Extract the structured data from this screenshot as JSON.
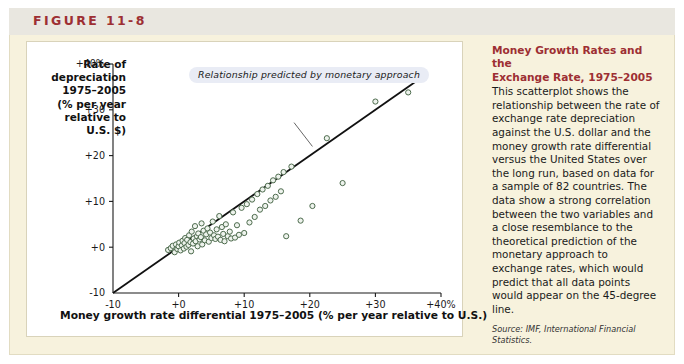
{
  "figure": {
    "label": "FIGURE 11-8",
    "label_color": "#9d2f33",
    "card_background": "#f7f2dd",
    "header_band_color": "#e9e7e0",
    "panel_background": "#ffffff"
  },
  "sidebar": {
    "title_line1": "Money Growth Rates and the",
    "title_line2": "Exchange Rate, 1975–2005",
    "body": "This scatterplot shows the relationship between the rate of exchange rate depreciation against the U.S. dollar and the money growth rate differential versus the United States over the long run, based on data for a sample of 82 countries. The data show a strong correlation between the two variables and a close resemblance to the theoretical prediction of the monetary approach to exchange rates, which would predict that all data points would appear on the 45-degree line.",
    "source": "Source: IMF, International Financial Statistics."
  },
  "chart_data": {
    "type": "scatter",
    "title": "",
    "xlabel": "Money growth rate differential 1975–2005 (% per year relative to U.S.)",
    "ylabel_lines": [
      "Rate of",
      "depreciation",
      "1975–2005",
      "(% per year",
      "relative to",
      "U.S. $)"
    ],
    "xlim": [
      -10,
      40
    ],
    "ylim": [
      -10,
      40
    ],
    "xticks": [
      -10,
      0,
      10,
      20,
      30,
      40
    ],
    "xtick_labels": [
      "-10",
      "+0",
      "+10",
      "+20",
      "+30",
      "+40%"
    ],
    "yticks": [
      -10,
      0,
      10,
      20,
      30,
      40
    ],
    "ytick_labels": [
      "-10",
      "+0",
      "+10",
      "+20",
      "+30",
      "+40%"
    ],
    "grid": false,
    "legend": "none",
    "marker": {
      "shape": "open-circle",
      "stroke_color": "#4d6b4d",
      "fill_color": "#eef3ed",
      "radius": 2.6
    },
    "reference_line": {
      "name": "45-degree line",
      "color": "#111111",
      "from": [
        -10,
        -10
      ],
      "to": [
        36,
        36
      ],
      "slope": 1,
      "intercept": 0
    },
    "annotation": {
      "text": "Relationship predicted by monetary approach",
      "background": "#e9ecf5",
      "leader_from": [
        17.6,
        27.2
      ],
      "leader_to": [
        20.4,
        22.0
      ]
    },
    "n_points": 82,
    "points": [
      [
        -1.6,
        -0.6
      ],
      [
        -1.2,
        -0.2
      ],
      [
        -0.9,
        0.3
      ],
      [
        -0.6,
        -1.1
      ],
      [
        -0.4,
        0.6
      ],
      [
        -0.2,
        -0.4
      ],
      [
        0.0,
        0.2
      ],
      [
        0.1,
        1.0
      ],
      [
        0.3,
        -0.7
      ],
      [
        0.5,
        0.4
      ],
      [
        0.6,
        1.4
      ],
      [
        0.8,
        -0.3
      ],
      [
        0.9,
        0.9
      ],
      [
        1.0,
        2.0
      ],
      [
        1.2,
        0.1
      ],
      [
        1.3,
        1.6
      ],
      [
        1.5,
        0.5
      ],
      [
        1.6,
        2.6
      ],
      [
        1.8,
        1.1
      ],
      [
        1.9,
        -0.9
      ],
      [
        2.0,
        3.4
      ],
      [
        2.2,
        0.8
      ],
      [
        2.3,
        1.9
      ],
      [
        2.5,
        4.6
      ],
      [
        2.6,
        1.3
      ],
      [
        2.8,
        2.4
      ],
      [
        2.9,
        0.2
      ],
      [
        3.0,
        3.0
      ],
      [
        3.2,
        1.7
      ],
      [
        3.4,
        2.2
      ],
      [
        3.5,
        5.2
      ],
      [
        3.6,
        0.6
      ],
      [
        3.8,
        3.6
      ],
      [
        4.0,
        1.5
      ],
      [
        4.2,
        2.8
      ],
      [
        4.4,
        4.1
      ],
      [
        4.6,
        1.2
      ],
      [
        4.8,
        3.2
      ],
      [
        5.0,
        2.0
      ],
      [
        5.2,
        5.6
      ],
      [
        5.4,
        2.6
      ],
      [
        5.6,
        1.8
      ],
      [
        5.8,
        3.9
      ],
      [
        6.0,
        2.3
      ],
      [
        6.2,
        6.8
      ],
      [
        6.4,
        1.6
      ],
      [
        6.6,
        4.4
      ],
      [
        6.8,
        2.9
      ],
      [
        7.0,
        1.3
      ],
      [
        7.2,
        5.0
      ],
      [
        7.5,
        2.4
      ],
      [
        7.8,
        3.4
      ],
      [
        8.0,
        1.9
      ],
      [
        8.3,
        7.6
      ],
      [
        8.6,
        2.1
      ],
      [
        8.9,
        4.8
      ],
      [
        9.2,
        2.7
      ],
      [
        9.6,
        8.6
      ],
      [
        10.0,
        3.1
      ],
      [
        10.4,
        9.4
      ],
      [
        10.8,
        5.4
      ],
      [
        11.2,
        10.4
      ],
      [
        11.6,
        6.6
      ],
      [
        12.0,
        11.6
      ],
      [
        12.4,
        8.2
      ],
      [
        12.8,
        12.6
      ],
      [
        13.2,
        9.0
      ],
      [
        13.6,
        13.4
      ],
      [
        14.0,
        10.2
      ],
      [
        14.4,
        14.6
      ],
      [
        14.8,
        11.0
      ],
      [
        15.2,
        15.4
      ],
      [
        15.6,
        12.2
      ],
      [
        16.0,
        16.4
      ],
      [
        16.4,
        2.4
      ],
      [
        17.2,
        17.6
      ],
      [
        18.6,
        5.8
      ],
      [
        20.4,
        9.0
      ],
      [
        22.6,
        23.8
      ],
      [
        25.0,
        14.0
      ],
      [
        30.0,
        31.8
      ],
      [
        35.0,
        33.8
      ]
    ]
  }
}
